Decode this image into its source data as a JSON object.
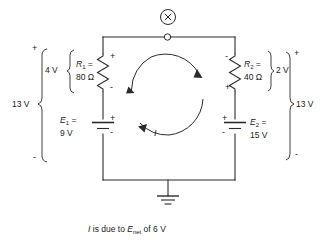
{
  "figure": {
    "type": "circuit-schematic",
    "caption_parts": {
      "lead": "I",
      "mid": " is due to ",
      "symbol": "E",
      "symbol_sub": "net",
      "tail": " of 6 V"
    },
    "caption_full": "I is due to Enet of 6 V"
  },
  "meter": {
    "name": "X",
    "glyph": "X",
    "terminal": "open-circle"
  },
  "components": {
    "r1": {
      "ref": "R",
      "ref_sub": "1",
      "ref_eq": "R₁ =",
      "value": "80 Ω",
      "polarity_top": "+",
      "polarity_bottom": "-",
      "drop_label": "4 V"
    },
    "r2": {
      "ref": "R",
      "ref_sub": "2",
      "ref_eq": "R₂ =",
      "value": "40 Ω",
      "polarity_top": "-",
      "polarity_bottom": "+",
      "drop_label": "2 V"
    },
    "e1": {
      "ref": "E",
      "ref_sub": "1",
      "ref_eq": "E₁ =",
      "value": "9 V",
      "polarity_top": "+",
      "polarity_bottom": "-"
    },
    "e2": {
      "ref": "E",
      "ref_sub": "2",
      "ref_eq": "E₂ =",
      "value": "15 V",
      "polarity_top": "+",
      "polarity_bottom": "-"
    }
  },
  "brackets": {
    "left_total": {
      "value": "13 V",
      "polarity_top": "+",
      "polarity_bottom": "-"
    },
    "right_total": {
      "value": "13 V",
      "polarity_top": "+",
      "polarity_bottom": "-"
    }
  },
  "current": {
    "label": "I",
    "direction": "clockwise"
  },
  "ground": {
    "name": "earth-ground"
  },
  "colors": {
    "ink": "#1a1a1a",
    "wire": "#2b2b2b",
    "background": "#ffffff"
  }
}
